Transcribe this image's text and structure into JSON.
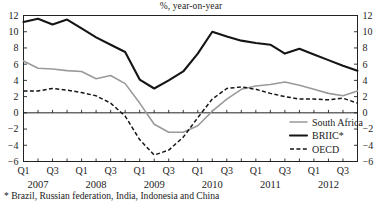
{
  "chart_data": {
    "type": "line",
    "title": "%, year-on-year",
    "subtitle": "",
    "xlabel": "",
    "ylabel": "",
    "ylim": [
      -6,
      12
    ],
    "yticks": [
      12,
      10,
      8,
      6,
      4,
      2,
      0,
      -2,
      -4,
      -6
    ],
    "ytick_labels": [
      "12",
      "10",
      "8",
      "6",
      "4",
      "2",
      "0",
      "−2",
      "−4",
      "−6"
    ],
    "grid": false,
    "dual_y_axis": true,
    "legend_position": "bottom-right",
    "x": [
      "2007Q1",
      "2007Q2",
      "2007Q3",
      "2007Q4",
      "2008Q1",
      "2008Q2",
      "2008Q3",
      "2008Q4",
      "2009Q1",
      "2009Q2",
      "2009Q3",
      "2009Q4",
      "2010Q1",
      "2010Q2",
      "2010Q3",
      "2010Q4",
      "2011Q1",
      "2011Q2",
      "2011Q3",
      "2011Q4",
      "2012Q1",
      "2012Q2",
      "2012Q3",
      "2012Q4"
    ],
    "xtick_labels": [
      "Q1",
      "Q3",
      "Q1",
      "Q3",
      "Q1",
      "Q3",
      "Q1",
      "Q3",
      "Q1",
      "Q3",
      "Q1",
      "Q3"
    ],
    "xtick_positions": [
      "2007Q1",
      "2007Q3",
      "2008Q1",
      "2008Q3",
      "2009Q1",
      "2009Q3",
      "2010Q1",
      "2010Q3",
      "2011Q1",
      "2011Q3",
      "2012Q1",
      "2012Q3"
    ],
    "year_labels": [
      "2007",
      "2008",
      "2009",
      "2010",
      "2011",
      "2012"
    ],
    "series": [
      {
        "name": "South Africa",
        "style": "solid",
        "color": "#9a9a9a",
        "values": [
          6.4,
          5.5,
          5.4,
          5.2,
          5.1,
          4.2,
          4.6,
          3.6,
          1.2,
          -1.4,
          -2.4,
          -2.4,
          -1.6,
          0.2,
          1.7,
          2.9,
          3.3,
          3.5,
          3.8,
          3.4,
          2.9,
          2.4,
          2.1,
          2.7
        ]
      },
      {
        "name": "BRIIC*",
        "style": "solid",
        "color": "#151515",
        "values": [
          11.2,
          11.6,
          10.9,
          11.5,
          10.4,
          9.3,
          8.4,
          7.5,
          4.1,
          3.0,
          4.0,
          5.1,
          7.3,
          10.0,
          9.4,
          8.9,
          8.6,
          8.4,
          7.3,
          7.9,
          7.2,
          6.5,
          5.8,
          5.2
        ]
      },
      {
        "name": "OECD",
        "style": "dashed",
        "color": "#151515",
        "values": [
          2.7,
          2.7,
          3.0,
          2.8,
          2.5,
          2.1,
          1.2,
          -0.4,
          -3.3,
          -5.2,
          -4.6,
          -3.0,
          -0.6,
          1.7,
          3.0,
          3.2,
          2.9,
          2.4,
          2.0,
          1.7,
          1.7,
          1.6,
          1.8,
          1.2
        ]
      }
    ],
    "footnote": "* Brazil, Russian federation, India, Indonesia and China"
  },
  "legend": {
    "items": [
      {
        "label": "South Africa"
      },
      {
        "label": "BRIIC*"
      },
      {
        "label": "OECD"
      }
    ]
  }
}
